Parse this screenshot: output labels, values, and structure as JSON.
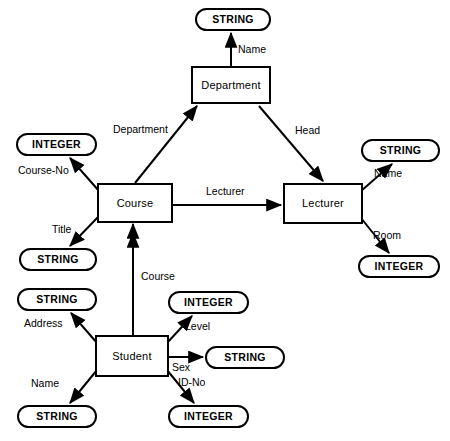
{
  "diagram": {
    "stroke_color": "#000000",
    "background_color": "#ffffff",
    "entities": [
      {
        "id": "department",
        "label": "Department",
        "x": 191,
        "y": 66,
        "w": 80,
        "h": 38
      },
      {
        "id": "course",
        "label": "Course",
        "x": 97,
        "y": 183,
        "w": 76,
        "h": 40
      },
      {
        "id": "lecturer",
        "label": "Lecturer",
        "x": 283,
        "y": 183,
        "w": 80,
        "h": 41
      },
      {
        "id": "student",
        "label": "Student",
        "x": 95,
        "y": 335,
        "w": 74,
        "h": 42
      }
    ],
    "values": [
      {
        "id": "dept-name-string",
        "label": "STRING",
        "x": 195,
        "y": 8,
        "w": 76,
        "h": 23
      },
      {
        "id": "course-no-integer",
        "label": "INTEGER",
        "x": 16,
        "y": 133,
        "w": 81,
        "h": 23
      },
      {
        "id": "course-title-string",
        "label": "STRING",
        "x": 19,
        "y": 248,
        "w": 78,
        "h": 23
      },
      {
        "id": "lecturer-name-string",
        "label": "STRING",
        "x": 361,
        "y": 139,
        "w": 79,
        "h": 23
      },
      {
        "id": "lecturer-room-integer",
        "label": "INTEGER",
        "x": 358,
        "y": 255,
        "w": 82,
        "h": 23
      },
      {
        "id": "student-address-string",
        "label": "STRING",
        "x": 17,
        "y": 288,
        "w": 80,
        "h": 23
      },
      {
        "id": "student-level-integer",
        "label": "INTEGER",
        "x": 168,
        "y": 291,
        "w": 81,
        "h": 23
      },
      {
        "id": "student-sex-string",
        "label": "STRING",
        "x": 205,
        "y": 346,
        "w": 80,
        "h": 23
      },
      {
        "id": "student-name-string",
        "label": "STRING",
        "x": 17,
        "y": 405,
        "w": 80,
        "h": 23
      },
      {
        "id": "student-idno-integer",
        "label": "INTEGER",
        "x": 168,
        "y": 405,
        "w": 81,
        "h": 23
      }
    ],
    "edges": [
      {
        "id": "department-name",
        "label": "Name",
        "from": "department",
        "to": "dept-name-string",
        "x1": 231,
        "y1": 66,
        "x2": 231,
        "y2": 33,
        "label_x": 238,
        "label_y": 44,
        "double_head": false
      },
      {
        "id": "course-department",
        "label": "Department",
        "from": "course",
        "to": "department",
        "x1": 135,
        "y1": 183,
        "x2": 197,
        "y2": 106,
        "label_x": 113,
        "label_y": 124,
        "double_head": false
      },
      {
        "id": "department-head",
        "label": "Head",
        "from": "department",
        "to": "lecturer",
        "x1": 259,
        "y1": 106,
        "x2": 323,
        "y2": 181,
        "label_x": 295,
        "label_y": 125,
        "double_head": false
      },
      {
        "id": "course-lecturer",
        "label": "Lecturer",
        "from": "course",
        "to": "lecturer",
        "x1": 173,
        "y1": 205,
        "x2": 281,
        "y2": 205,
        "label_x": 206,
        "label_y": 186,
        "double_head": false
      },
      {
        "id": "course-course-no",
        "label": "Course-No",
        "from": "course",
        "to": "course-no-integer",
        "x1": 99,
        "y1": 191,
        "x2": 70,
        "y2": 158,
        "label_x": 18,
        "label_y": 165,
        "double_head": false
      },
      {
        "id": "course-title",
        "label": "Title",
        "from": "course",
        "to": "course-title-string",
        "x1": 99,
        "y1": 216,
        "x2": 70,
        "y2": 246,
        "label_x": 52,
        "label_y": 224,
        "double_head": false
      },
      {
        "id": "lecturer-name",
        "label": "Name",
        "from": "lecturer",
        "to": "lecturer-name-string",
        "x1": 361,
        "y1": 191,
        "x2": 392,
        "y2": 164,
        "label_x": 374,
        "label_y": 168,
        "double_head": false
      },
      {
        "id": "lecturer-room",
        "label": "Room",
        "from": "lecturer",
        "to": "lecturer-room-integer",
        "x1": 361,
        "y1": 218,
        "x2": 389,
        "y2": 253,
        "label_x": 373,
        "label_y": 230,
        "double_head": false
      },
      {
        "id": "student-course",
        "label": "Course",
        "from": "student",
        "to": "course",
        "x1": 133,
        "y1": 335,
        "x2": 133,
        "y2": 224,
        "label_x": 141,
        "label_y": 271,
        "double_head": true
      },
      {
        "id": "student-address",
        "label": "Address",
        "from": "student",
        "to": "student-address-string",
        "x1": 97,
        "y1": 343,
        "x2": 71,
        "y2": 313,
        "label_x": 24,
        "label_y": 318,
        "double_head": false
      },
      {
        "id": "student-level",
        "label": "Level",
        "from": "student",
        "to": "student-level-integer",
        "x1": 167,
        "y1": 343,
        "x2": 192,
        "y2": 316,
        "label_x": 185,
        "label_y": 321,
        "double_head": false
      },
      {
        "id": "student-sex",
        "label": "Sex",
        "from": "student",
        "to": "student-sex-string",
        "x1": 169,
        "y1": 357,
        "x2": 203,
        "y2": 357,
        "label_x": 172,
        "label_y": 362,
        "double_head": false
      },
      {
        "id": "student-name",
        "label": "Name",
        "from": "student",
        "to": "student-name-string",
        "x1": 97,
        "y1": 370,
        "x2": 70,
        "y2": 403,
        "label_x": 31,
        "label_y": 378,
        "double_head": false
      },
      {
        "id": "student-id-no",
        "label": "ID-No",
        "from": "student",
        "to": "student-idno-integer",
        "x1": 167,
        "y1": 370,
        "x2": 194,
        "y2": 403,
        "label_x": 178,
        "label_y": 377,
        "double_head": false
      }
    ]
  }
}
